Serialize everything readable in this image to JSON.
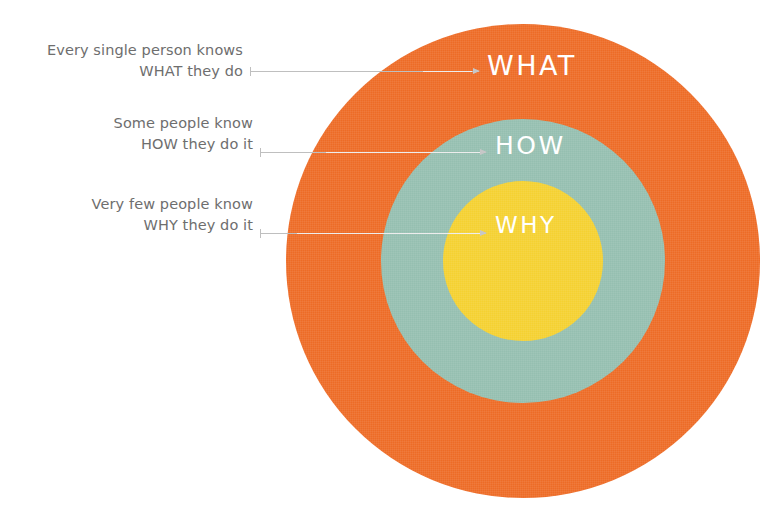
{
  "diagram": {
    "name": "golden-circle",
    "type": "concentric-circles",
    "background_color": "#FFFFFF",
    "title_remnant": "",
    "center": {
      "x": 523,
      "y": 261
    },
    "rings": [
      {
        "id": "what",
        "word": "WHAT",
        "color": "#ED6B26",
        "color_name": "orange",
        "radius": 237,
        "word_color": "#FFFFFF",
        "order": 1
      },
      {
        "id": "how",
        "word": "HOW",
        "color": "#95BFB0",
        "color_name": "sage-green",
        "radius": 142,
        "word_color": "#FFFFFF",
        "order": 2
      },
      {
        "id": "why",
        "word": "WHY",
        "color": "#F5D130",
        "color_name": "yellow",
        "radius": 80,
        "word_color": "#FFFFFF",
        "order": 3
      }
    ],
    "captions": [
      {
        "id": "what",
        "line1": "Every single person knows",
        "line2": "WHAT they do",
        "text_color": "#6E6E6E",
        "points_to": "WHAT"
      },
      {
        "id": "how",
        "line1": "Some people know",
        "line2": "HOW they do it",
        "text_color": "#6E6E6E",
        "points_to": "HOW"
      },
      {
        "id": "why",
        "line1": "Very few people know",
        "line2": "WHY they do it",
        "text_color": "#6E6E6E",
        "points_to": "WHY"
      }
    ],
    "leader_line_color": "#BFBFBF"
  }
}
